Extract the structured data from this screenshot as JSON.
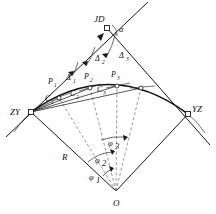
{
  "figure": {
    "kind": "curve-deflection-angle-diagram",
    "background_color": "#ffffff",
    "line_color": "#1a1a1a",
    "dashed_color": "#6b6b6b",
    "width": 216,
    "height": 214
  },
  "points": {
    "jd": {
      "label": "JD",
      "x": 107,
      "y": 28,
      "marker": "square"
    },
    "zy": {
      "label": "ZY",
      "x": 31,
      "y": 112,
      "marker": "square"
    },
    "yz": {
      "label": "YZ",
      "x": 188,
      "y": 114,
      "marker": "square"
    },
    "o": {
      "label": "O",
      "x": 116,
      "y": 191,
      "marker": "none"
    },
    "p1": {
      "label": "P",
      "sub": "1",
      "x": 57,
      "y": 88
    },
    "p2": {
      "label": "P",
      "sub": "2",
      "x": 89,
      "y": 81
    },
    "p3": {
      "label": "P",
      "sub": "3",
      "x": 117,
      "y": 80
    }
  },
  "chords": {
    "c1": {
      "label": "C",
      "sub": "1"
    },
    "c2": {
      "label": "C",
      "sub": "2"
    },
    "c3": {
      "label": "C",
      "sub": "3"
    }
  },
  "deflection_angles": {
    "d1": {
      "label": "Δ",
      "sub": "1"
    },
    "d2": {
      "label": "Δ",
      "sub": "2"
    },
    "d3": {
      "label": "Δ",
      "sub": "3"
    }
  },
  "central_angles": {
    "phi1": {
      "label": "φ",
      "sub": "1"
    },
    "phi2": {
      "label": "φ",
      "sub": "2"
    },
    "phi3": {
      "label": "φ",
      "sub": "3"
    }
  },
  "intersection_angle": {
    "label": "α"
  },
  "radius": {
    "label": "R"
  }
}
